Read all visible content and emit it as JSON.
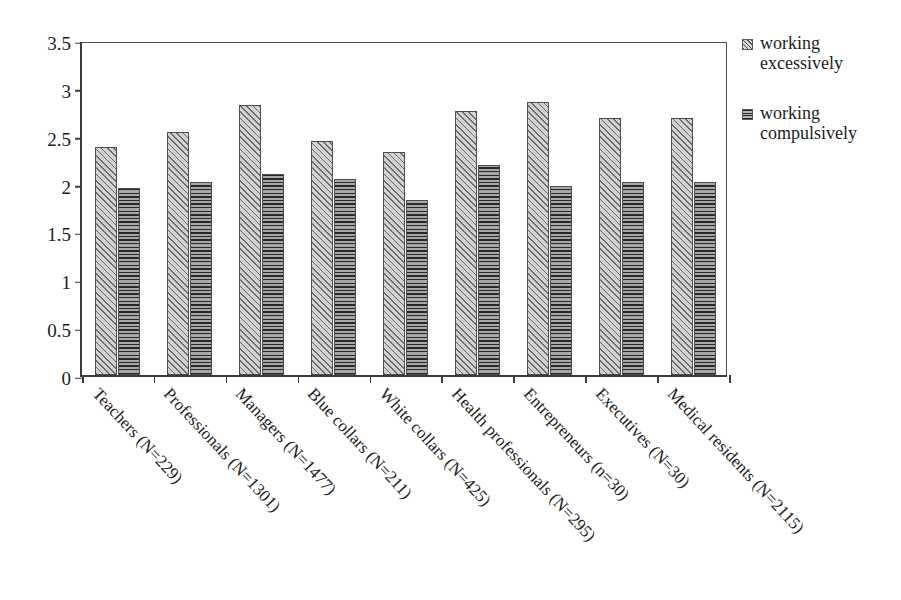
{
  "chart_data": {
    "type": "bar",
    "title": "",
    "subtitle": "",
    "xlabel": "",
    "ylabel": "",
    "ylim": [
      0,
      3.5
    ],
    "ytick_labels": [
      "0",
      "0.5",
      "1",
      "1.5",
      "2",
      "2.5",
      "3",
      "3.5"
    ],
    "ytick_values": [
      0,
      0.5,
      1,
      1.5,
      2,
      2.5,
      3,
      3.5
    ],
    "grid": false,
    "legend_position": "right",
    "categories": [
      "Teachers (N=229)",
      "Professionals (N=1301)",
      "Managers (N=1477)",
      "Blue collars (N=211)",
      "White collars (N=425)",
      "Health professionals (N=295)",
      "Entrepreneurs (n=30)",
      "Executives (N=30)",
      "Medical residents (N=2115)"
    ],
    "series": [
      {
        "name": "working excessively",
        "pattern": "diagonal-hatch",
        "color": "#d2d2d2",
        "values": [
          2.38,
          2.54,
          2.82,
          2.44,
          2.33,
          2.76,
          2.85,
          2.69,
          2.69
        ]
      },
      {
        "name": "working compulsively",
        "pattern": "horizontal-lines",
        "color": "#6e6e6e",
        "values": [
          1.95,
          2.02,
          2.1,
          2.05,
          1.83,
          2.19,
          1.97,
          2.02,
          2.02
        ]
      }
    ]
  },
  "legend": {
    "items": [
      {
        "label_line1": "working",
        "label_line2": "excessively"
      },
      {
        "label_line1": "working",
        "label_line2": "compulsively"
      }
    ]
  },
  "axis": {
    "y_labels": [
      "3.5",
      "3",
      "2.5",
      "2",
      "1.5",
      "1",
      "0.5",
      "0"
    ]
  }
}
